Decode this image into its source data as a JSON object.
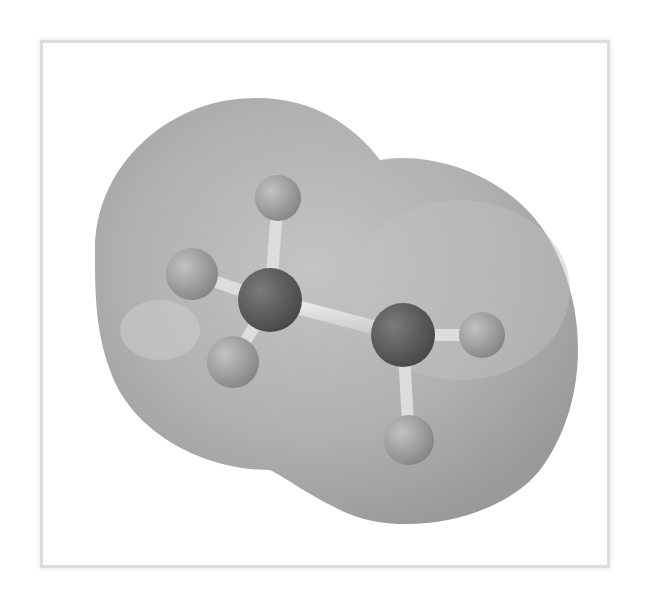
{
  "figure": {
    "alt": "Ball-and-stick model of ethane (C2H6) enclosed in a translucent gray electron density surface",
    "colors": {
      "background": "#ffffff",
      "frame": "#dcdcdc",
      "surface": "#a8a8a8",
      "carbon": "#5a5a5a",
      "hydrogen": "#9a9a9a",
      "bond": "#d8d8d8"
    },
    "atoms": [
      {
        "element": "C",
        "label": "carbon-1",
        "cx": 270,
        "cy": 300,
        "r": 32
      },
      {
        "element": "C",
        "label": "carbon-2",
        "cx": 403,
        "cy": 335,
        "r": 32
      },
      {
        "element": "H",
        "label": "hydrogen-1",
        "cx": 278,
        "cy": 198,
        "r": 23
      },
      {
        "element": "H",
        "label": "hydrogen-2",
        "cx": 192,
        "cy": 274,
        "r": 26
      },
      {
        "element": "H",
        "label": "hydrogen-3",
        "cx": 233,
        "cy": 362,
        "r": 26
      },
      {
        "element": "H",
        "label": "hydrogen-4",
        "cx": 482,
        "cy": 335,
        "r": 23
      },
      {
        "element": "H",
        "label": "hydrogen-5",
        "cx": 409,
        "cy": 440,
        "r": 25
      }
    ]
  }
}
